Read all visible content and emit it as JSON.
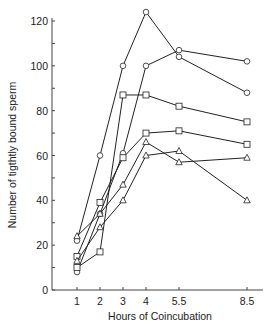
{
  "chart_data": {
    "type": "line",
    "title": "",
    "xlabel": "Hours of Coincubation",
    "ylabel": "Number of tigthtly bound sperm",
    "x": [
      1,
      2,
      3,
      4,
      5.5,
      8.5
    ],
    "x_tick_labels": [
      "1",
      "2",
      "3",
      "4",
      "5.5",
      "8.5"
    ],
    "y_tick_labels": [
      "0",
      "20",
      "40",
      "60",
      "80",
      "100",
      "120"
    ],
    "ylim": [
      0,
      120
    ],
    "grid": false,
    "legend": "none",
    "series": [
      {
        "name": "circle-1",
        "marker": "circle",
        "values": [
          22,
          60,
          100,
          124,
          104,
          88
        ]
      },
      {
        "name": "circle-2",
        "marker": "circle",
        "values": [
          8,
          34,
          61,
          100,
          107,
          102
        ]
      },
      {
        "name": "square-1",
        "marker": "square",
        "values": [
          10,
          17,
          87,
          87,
          82,
          75
        ]
      },
      {
        "name": "square-2",
        "marker": "square",
        "values": [
          15,
          39,
          59,
          70,
          71,
          65
        ]
      },
      {
        "name": "triangle-1",
        "marker": "triangle",
        "values": [
          24,
          34,
          47,
          66,
          57,
          59
        ]
      },
      {
        "name": "triangle-2",
        "marker": "triangle",
        "values": [
          13,
          28,
          40,
          60,
          62,
          40
        ]
      }
    ]
  },
  "colors": {
    "line": "#222222",
    "marker_fill": "#ffffff",
    "axis": "#444444"
  }
}
